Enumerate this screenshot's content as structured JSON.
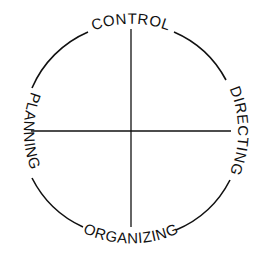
{
  "diagram": {
    "center": [
      131,
      131
    ],
    "radius": 107,
    "stroke_color": "#111111",
    "labels": {
      "top": "CONTROL",
      "right": "DIRECTING",
      "bottom": "ORGANIZING",
      "left": "PLANNING"
    }
  }
}
